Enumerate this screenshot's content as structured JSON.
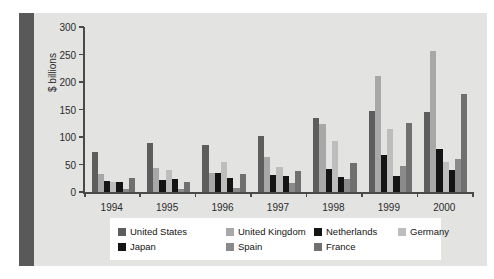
{
  "chart_data": {
    "type": "bar",
    "title": "",
    "xlabel": "",
    "ylabel": "$ billions",
    "ylim": [
      0,
      300
    ],
    "yticks": [
      0,
      50,
      100,
      150,
      200,
      250,
      300
    ],
    "ytick_labels": [
      "0",
      "50",
      "100",
      "150",
      "200",
      "250",
      "300"
    ],
    "grid": false,
    "legend_position": "bottom",
    "categories": [
      "1994",
      "1995",
      "1996",
      "1997",
      "1998",
      "1999",
      "2000"
    ],
    "series": [
      {
        "name": "United States",
        "color": "#5d5d5d",
        "values": [
          73,
          90,
          85,
          102,
          135,
          147,
          145
        ]
      },
      {
        "name": "United Kingdom",
        "color": "#a8a8a8",
        "values": [
          32,
          44,
          35,
          64,
          123,
          211,
          257
        ]
      },
      {
        "name": "Netherlands",
        "color": "#141414",
        "values": [
          20,
          22,
          35,
          31,
          42,
          68,
          79
        ]
      },
      {
        "name": "Germany",
        "color": "#bdbdbd",
        "values": [
          19,
          40,
          54,
          45,
          93,
          114,
          55
        ]
      },
      {
        "name": "Japan",
        "color": "#141414",
        "values": [
          19,
          23,
          25,
          30,
          28,
          30,
          40
        ]
      },
      {
        "name": "Spain",
        "color": "#8a8a8a",
        "values": [
          5,
          6,
          7,
          17,
          24,
          48,
          60
        ]
      },
      {
        "name": "France",
        "color": "#707070",
        "values": [
          26,
          19,
          32,
          39,
          53,
          126,
          179
        ]
      }
    ]
  },
  "axis": {
    "y_title": "$ billions"
  },
  "legend": {
    "rows": [
      [
        {
          "label": "United States",
          "swatch": "#5d5d5d"
        },
        {
          "label": "United Kingdom",
          "swatch": "#a8a8a8"
        },
        {
          "label": "Netherlands",
          "swatch": "#141414"
        },
        {
          "label": "Germany",
          "swatch": "#bdbdbd"
        }
      ],
      [
        {
          "label": "Japan",
          "swatch": "#141414"
        },
        {
          "label": "Spain",
          "swatch": "#8a8a8a"
        },
        {
          "label": "France",
          "swatch": "#707070"
        }
      ]
    ]
  },
  "colors": {
    "plate_background": "#e3e3e1",
    "spine": "#595959",
    "axis": "#4a4a4a",
    "legend_background": "#ffffff",
    "figure_background": "#ffffff"
  }
}
